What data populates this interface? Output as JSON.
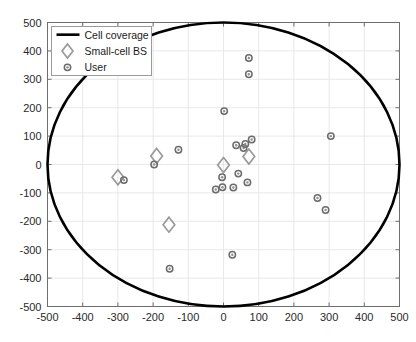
{
  "chart_data": {
    "type": "scatter",
    "title": "",
    "xlabel": "",
    "ylabel": "",
    "xlim": [
      -500,
      500
    ],
    "ylim": [
      -500,
      500
    ],
    "xticks": [
      -500,
      -400,
      -300,
      -200,
      -100,
      0,
      100,
      200,
      300,
      400,
      500
    ],
    "yticks": [
      -500,
      -400,
      -300,
      -200,
      -100,
      0,
      100,
      200,
      300,
      400,
      500
    ],
    "xtick_labels": [
      "-500",
      "-400",
      "-300",
      "-200",
      "-100",
      "0",
      "100",
      "200",
      "300",
      "400",
      "500"
    ],
    "ytick_labels": [
      "-500",
      "-400",
      "-300",
      "-200",
      "-100",
      "0",
      "100",
      "200",
      "300",
      "400",
      "500"
    ],
    "grid": true,
    "legend_position": "upper-left",
    "series": [
      {
        "name": "Cell coverage",
        "type": "ellipse",
        "center": [
          0,
          0
        ],
        "radius_x": 500,
        "radius_y": 500,
        "color": "#000000",
        "linewidth": 2.6
      },
      {
        "name": "Small-cell BS",
        "type": "scatter",
        "marker": "diamond",
        "color": "#9a9a9a",
        "points": [
          [
            -300,
            -45
          ],
          [
            -190,
            30
          ],
          [
            -155,
            -212
          ],
          [
            0,
            -2
          ],
          [
            72,
            28
          ]
        ]
      },
      {
        "name": "User",
        "type": "scatter",
        "marker": "circle",
        "color": "#6b6b6b",
        "points": [
          [
            -283,
            -55
          ],
          [
            -197,
            0
          ],
          [
            -128,
            52
          ],
          [
            -153,
            -367
          ],
          [
            -22,
            -88
          ],
          [
            -4,
            -45
          ],
          [
            -3,
            -80
          ],
          [
            2,
            188
          ],
          [
            25,
            -318
          ],
          [
            28,
            -81
          ],
          [
            36,
            68
          ],
          [
            42,
            -32
          ],
          [
            57,
            58
          ],
          [
            62,
            72
          ],
          [
            68,
            -63
          ],
          [
            72,
            375
          ],
          [
            72,
            318
          ],
          [
            80,
            88
          ],
          [
            267,
            -118
          ],
          [
            290,
            -160
          ],
          [
            305,
            100
          ]
        ]
      }
    ]
  },
  "legend": {
    "entries": [
      {
        "label": "Cell coverage",
        "icon": "line-swatch"
      },
      {
        "label": "Small-cell BS",
        "icon": "diamond-marker"
      },
      {
        "label": "User",
        "icon": "circle-marker"
      }
    ]
  },
  "colors": {
    "coverage": "#000000",
    "base_station": "#9a9a9a",
    "user": "#6b6b6b",
    "grid": "#e2e2e8",
    "axis": "#6e6e6e",
    "background": "#ffffff"
  }
}
